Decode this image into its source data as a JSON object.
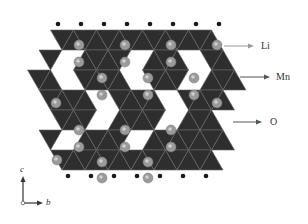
{
  "diagram": {
    "type": "crystal-structure",
    "colors": {
      "polyhedra": "#2e2e2e",
      "polyhedra_edge": "#6a6a6a",
      "li_sphere": "#9a9a9a",
      "li_sphere_highlight": "#d0d0d0",
      "oxygen_vertex": "#1a1a1a",
      "arrow": "#888888",
      "label_text": "#333333"
    },
    "legend": [
      {
        "label": "Li",
        "target": "lithium-ion-sphere"
      },
      {
        "label": "Mn",
        "target": "manganese-octahedron"
      },
      {
        "label": "O",
        "target": "oxygen-vertex"
      }
    ],
    "axes": {
      "vertical": "c",
      "horizontal": "b"
    }
  }
}
